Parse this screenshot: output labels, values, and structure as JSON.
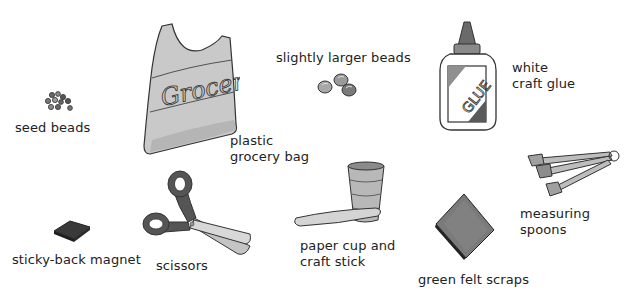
{
  "items": [
    {
      "id": "seed-beads",
      "label": "seed beads"
    },
    {
      "id": "plastic-grocery-bag",
      "label": "plastic\ngrocery bag",
      "bag_text": "Grocery"
    },
    {
      "id": "slightly-larger-beads",
      "label": "slightly larger beads"
    },
    {
      "id": "white-craft-glue",
      "label": "white\ncraft glue",
      "bottle_text": "GLUE"
    },
    {
      "id": "measuring-spoons",
      "label": "measuring\nspoons"
    },
    {
      "id": "sticky-back-magnet",
      "label": "sticky-back magnet"
    },
    {
      "id": "scissors",
      "label": "scissors"
    },
    {
      "id": "paper-cup-and-craft-stick",
      "label": "paper cup and\ncraft stick"
    },
    {
      "id": "green-felt-scraps",
      "label": "green felt scraps"
    }
  ],
  "colors": {
    "background": "#ffffff",
    "outline": "#333333",
    "light_gray": "#cfcfcf",
    "mid_gray": "#9a9a9a",
    "dark_gray": "#4a4a4a",
    "text": "#222222"
  }
}
